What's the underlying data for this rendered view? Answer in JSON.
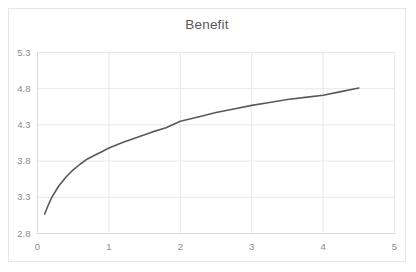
{
  "chart_data": {
    "type": "line",
    "title": "Benefit",
    "xlabel": "",
    "ylabel": "",
    "xlim": [
      0,
      5
    ],
    "ylim": [
      2.8,
      5.3
    ],
    "xticks": [
      "0",
      "1",
      "2",
      "3",
      "4",
      "5"
    ],
    "xtick_values": [
      0,
      1,
      2,
      3,
      4,
      5
    ],
    "yticks": [
      "2.8",
      "3.3",
      "3.8",
      "4.3",
      "4.8",
      "5.3"
    ],
    "ytick_values": [
      2.8,
      3.3,
      3.8,
      4.3,
      4.8,
      5.3
    ],
    "grid": true,
    "legend": false,
    "series": [
      {
        "name": "Benefit",
        "color": "#595959",
        "line_width": 1.6,
        "x": [
          0.1,
          0.15,
          0.2,
          0.25,
          0.3,
          0.4,
          0.5,
          0.6,
          0.7,
          0.8,
          0.9,
          1.0,
          1.2,
          1.4,
          1.6,
          1.8,
          2.0,
          2.25,
          2.5,
          2.75,
          3.0,
          3.25,
          3.5,
          3.75,
          4.0,
          4.25,
          4.5
        ],
        "y": [
          3.07,
          3.19,
          3.3,
          3.38,
          3.46,
          3.58,
          3.68,
          3.76,
          3.83,
          3.88,
          3.93,
          3.98,
          4.06,
          4.13,
          4.2,
          4.26,
          4.35,
          4.41,
          4.47,
          4.52,
          4.57,
          4.61,
          4.65,
          4.68,
          4.71,
          4.76,
          4.81
        ]
      }
    ]
  },
  "style": {
    "grid_color": "#e8e8e8",
    "axis_color": "#d9d9d9",
    "frame_color": "#e6e6e6",
    "tick_text_color": "#8c8c8c",
    "title_color": "#595959",
    "background": "#ffffff"
  }
}
